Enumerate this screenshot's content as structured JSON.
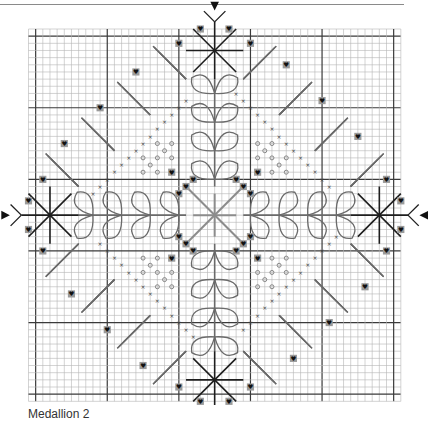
{
  "caption": "Medallion 2",
  "grid": {
    "cells": 52,
    "cell_px": 7.16,
    "origin_x": 28.5,
    "origin_y": 29,
    "major_every": 10,
    "major_offset": 1,
    "minor_color": "#b5b5b5",
    "major_color": "#3a3a3a"
  },
  "colors": {
    "dark_stitch": "#1e1e1e",
    "mid_stitch": "#6a6a6a",
    "light_stitch": "#8c8c8c",
    "heart_bg": "#9a9a9a",
    "heart": "#111111",
    "cross": "#444444",
    "circle": "#7a7a7a",
    "arrow": "#111111"
  },
  "symbols": {
    "heart": "♥",
    "cross": "×",
    "circle": "○"
  },
  "legend": []
}
